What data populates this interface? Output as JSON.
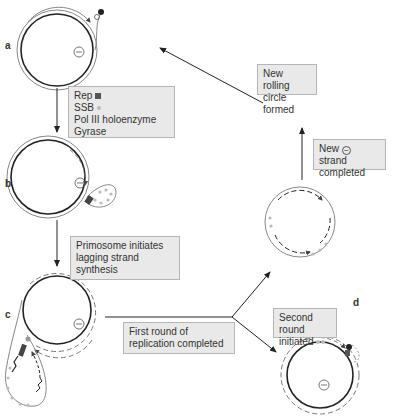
{
  "panels": {
    "a": {
      "letter": "a"
    },
    "b": {
      "letter": "b"
    },
    "c": {
      "letter": "c"
    },
    "d": {
      "letter": "d"
    }
  },
  "labels": {
    "box1": {
      "lines": [
        "Rep",
        "SSB",
        "Pol III holoenzyme",
        "Gyrase"
      ],
      "rep_icon": "dark-square",
      "ssb_icon": "grey-dot"
    },
    "box2": {
      "line1": "Primosome initiates",
      "line2": "lagging strand",
      "line3": "synthesis"
    },
    "box3": {
      "line1": "First round of",
      "line2": "replication completed"
    },
    "box4": {
      "line1": "Second round",
      "line2": "initiated"
    },
    "box5": {
      "line1_pre": "New",
      "minus": "−",
      "line1_post": "strand",
      "line2": "completed"
    },
    "box6": {
      "line1": "New rolling",
      "line2": "circle formed"
    }
  },
  "symbols": {
    "minus_strand": "−"
  },
  "colors": {
    "strand_dark": "#222222",
    "strand_outer": "#888888",
    "ssb": "#bbbbbb",
    "box_fill": "#e9e9e9",
    "box_border": "#b5b5b5"
  }
}
